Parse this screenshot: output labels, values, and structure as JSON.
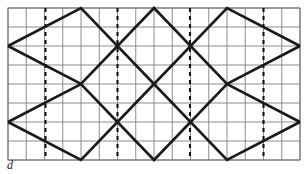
{
  "figure": {
    "caption": "d",
    "caption_style": "italic",
    "type": "geometric-lattice-diagram",
    "canvas": {
      "width": 308,
      "height": 174
    },
    "colors": {
      "background": "#ffffff",
      "grid_line": "#808080",
      "grid_border": "#707070",
      "wave_line": "#1a1a1a",
      "dashed_line": "#111111",
      "caption": "#1a1a1a"
    },
    "plot_area": {
      "x": 8,
      "y": 8,
      "width": 292,
      "height": 152
    },
    "grid": {
      "columns": 16,
      "rows": 8,
      "cell_width": 18.25,
      "cell_height": 19,
      "x_positions": [
        8,
        26.25,
        44.5,
        62.75,
        81,
        99.25,
        117.5,
        135.75,
        154,
        172.25,
        190.5,
        208.75,
        227,
        245.25,
        263.5,
        281.75,
        300
      ],
      "y_positions": [
        8,
        27,
        46,
        65,
        84,
        103,
        122,
        141,
        160
      ],
      "stroke_width": 0.9,
      "visible": true
    },
    "dashed_lines": {
      "count": 4,
      "stroke_width": 2.1,
      "dash_pattern": "4 4",
      "x_positions": [
        45.5,
        117.5,
        190,
        263.5
      ],
      "y_start": 8,
      "y_end": 160
    },
    "waves": {
      "stroke_width": 2.6,
      "stroke_linejoin": "miter",
      "upper": {
        "name": "upper-zigzag",
        "points": "8,46 81,8 154,84 227,8 300,46"
      },
      "lower": {
        "name": "lower-zigzag",
        "points": "8,122 81,160 154,84 227,160 300,122"
      },
      "upper_mirror": {
        "name": "upper-mirror-zigzag",
        "points": "8,46 81,84 154,8 227,84 300,46"
      },
      "lower_mirror": {
        "name": "lower-mirror-zigzag",
        "points": "8,122 81,84 154,160 227,84 300,122"
      }
    }
  }
}
